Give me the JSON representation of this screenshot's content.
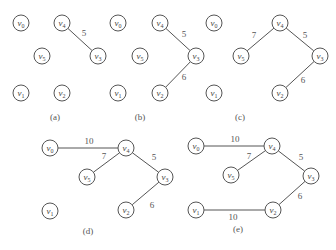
{
  "panels": [
    {
      "id": "a",
      "caption": "(a)",
      "caption_pos": [
        55,
        120
      ],
      "nodes": [
        {
          "name": "v",
          "sub": "0",
          "x": 21,
          "y": 23
        },
        {
          "name": "v",
          "sub": "4",
          "x": 62,
          "y": 23
        },
        {
          "name": "v",
          "sub": "5",
          "x": 42,
          "y": 56
        },
        {
          "name": "v",
          "sub": "3",
          "x": 98,
          "y": 56
        },
        {
          "name": "v",
          "sub": "1",
          "x": 21,
          "y": 93
        },
        {
          "name": "v",
          "sub": "2",
          "x": 62,
          "y": 93
        }
      ],
      "edges": [
        {
          "from": 1,
          "to": 3,
          "weight": "5",
          "lx": 84,
          "ly": 36
        }
      ]
    },
    {
      "id": "b",
      "caption": "(b)",
      "caption_pos": [
        140,
        120
      ],
      "nodes": [
        {
          "name": "v",
          "sub": "0",
          "x": 118,
          "y": 23
        },
        {
          "name": "v",
          "sub": "4",
          "x": 160,
          "y": 23
        },
        {
          "name": "v",
          "sub": "5",
          "x": 140,
          "y": 56
        },
        {
          "name": "v",
          "sub": "3",
          "x": 196,
          "y": 56
        },
        {
          "name": "v",
          "sub": "1",
          "x": 118,
          "y": 93
        },
        {
          "name": "v",
          "sub": "2",
          "x": 160,
          "y": 93
        }
      ],
      "edges": [
        {
          "from": 1,
          "to": 3,
          "weight": "5",
          "lx": 184,
          "ly": 37
        },
        {
          "from": 3,
          "to": 5,
          "weight": "6",
          "lx": 184,
          "ly": 80
        }
      ]
    },
    {
      "id": "c",
      "caption": "(c)",
      "caption_pos": [
        240,
        120
      ],
      "nodes": [
        {
          "name": "v",
          "sub": "0",
          "x": 214,
          "y": 23
        },
        {
          "name": "v",
          "sub": "4",
          "x": 280,
          "y": 23
        },
        {
          "name": "v",
          "sub": "5",
          "x": 241,
          "y": 56
        },
        {
          "name": "v",
          "sub": "3",
          "x": 320,
          "y": 56
        },
        {
          "name": "v",
          "sub": "1",
          "x": 214,
          "y": 93
        },
        {
          "name": "v",
          "sub": "2",
          "x": 280,
          "y": 93
        }
      ],
      "edges": [
        {
          "from": 1,
          "to": 2,
          "weight": "7",
          "lx": 254,
          "ly": 38
        },
        {
          "from": 1,
          "to": 3,
          "weight": "5",
          "lx": 305,
          "ly": 38
        },
        {
          "from": 3,
          "to": 5,
          "weight": "6",
          "lx": 303,
          "ly": 83
        }
      ]
    },
    {
      "id": "d",
      "caption": "(d)",
      "caption_pos": [
        88,
        234
      ],
      "nodes": [
        {
          "name": "v",
          "sub": "0",
          "x": 50,
          "y": 148
        },
        {
          "name": "v",
          "sub": "4",
          "x": 126,
          "y": 148
        },
        {
          "name": "v",
          "sub": "5",
          "x": 87,
          "y": 177
        },
        {
          "name": "v",
          "sub": "3",
          "x": 165,
          "y": 177
        },
        {
          "name": "v",
          "sub": "1",
          "x": 50,
          "y": 211
        },
        {
          "name": "v",
          "sub": "2",
          "x": 126,
          "y": 210
        }
      ],
      "edges": [
        {
          "from": 0,
          "to": 1,
          "weight": "10",
          "lx": 89,
          "ly": 144
        },
        {
          "from": 1,
          "to": 2,
          "weight": "7",
          "lx": 104,
          "ly": 159
        },
        {
          "from": 1,
          "to": 3,
          "weight": "5",
          "lx": 154,
          "ly": 160
        },
        {
          "from": 3,
          "to": 5,
          "weight": "6",
          "lx": 152,
          "ly": 208
        }
      ]
    },
    {
      "id": "e",
      "caption": "(e)",
      "caption_pos": [
        238,
        232
      ],
      "nodes": [
        {
          "name": "v",
          "sub": "0",
          "x": 196,
          "y": 146
        },
        {
          "name": "v",
          "sub": "4",
          "x": 272,
          "y": 146
        },
        {
          "name": "v",
          "sub": "5",
          "x": 231,
          "y": 175
        },
        {
          "name": "v",
          "sub": "3",
          "x": 311,
          "y": 176
        },
        {
          "name": "v",
          "sub": "1",
          "x": 196,
          "y": 210
        },
        {
          "name": "v",
          "sub": "2",
          "x": 273,
          "y": 210
        }
      ],
      "edges": [
        {
          "from": 0,
          "to": 1,
          "weight": "10",
          "lx": 235,
          "ly": 142
        },
        {
          "from": 1,
          "to": 2,
          "weight": "7",
          "lx": 249,
          "ly": 159
        },
        {
          "from": 1,
          "to": 3,
          "weight": "5",
          "lx": 301,
          "ly": 160
        },
        {
          "from": 3,
          "to": 5,
          "weight": "6",
          "lx": 300,
          "ly": 199
        },
        {
          "from": 4,
          "to": 5,
          "weight": "10",
          "lx": 233,
          "ly": 220
        }
      ]
    }
  ],
  "style": {
    "stroke_color": "#555555",
    "text_color": "#444444",
    "node_radius": 8
  }
}
